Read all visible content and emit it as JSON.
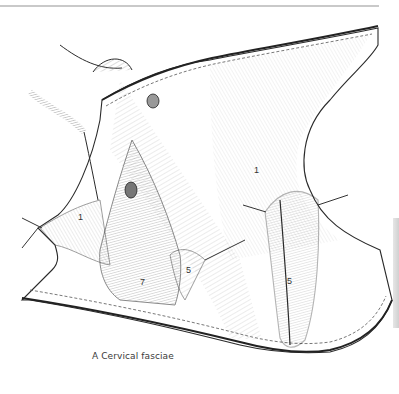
{
  "figure": {
    "caption": "A  Cervical fasciae",
    "labels": [
      {
        "text": "1",
        "x": 78,
        "y": 213
      },
      {
        "text": "1",
        "x": 254,
        "y": 166
      },
      {
        "text": "7",
        "x": 140,
        "y": 278
      },
      {
        "text": "5",
        "x": 186,
        "y": 266
      },
      {
        "text": "5",
        "x": 287,
        "y": 277
      }
    ]
  },
  "colors": {
    "ink": "#2a2a2a",
    "shade": "#8a8a8a",
    "rule": "#c9c9c9",
    "paper": "#ffffff"
  }
}
